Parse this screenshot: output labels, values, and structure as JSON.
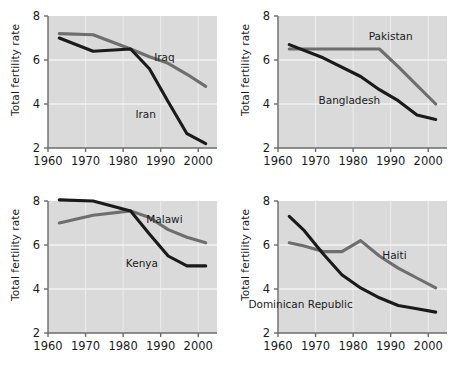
{
  "figure": {
    "title": "",
    "background": "#ffffff",
    "panel_background": "#dadada",
    "grid_color": "#f2f2f2",
    "axis_color": "#6b6b6b",
    "dark_series_color": "#1a1a1a",
    "light_series_color": "#6e6e6e"
  },
  "axis": {
    "ylabel": "Total fertility rate",
    "yticks": [
      "8",
      "6",
      "4",
      "2"
    ],
    "ytick_values": [
      8,
      6,
      4,
      2
    ],
    "ylim": [
      2,
      8
    ],
    "xticks": [
      "1960",
      "1970",
      "1980",
      "1990",
      "2000"
    ],
    "xtick_values": [
      1960,
      1970,
      1980,
      1990,
      2000
    ],
    "xlim": [
      1960,
      2005
    ]
  },
  "chart_data": [
    {
      "type": "line",
      "panel": "top-left",
      "title": "",
      "xlabel": "",
      "ylabel": "Total fertility rate",
      "xlim": [
        1960,
        2005
      ],
      "ylim": [
        2,
        8
      ],
      "grid": true,
      "legend": "inline-labels",
      "series": [
        {
          "name": "Iraq",
          "color": "#6e6e6e",
          "label_x": 1991,
          "label_y": 5.95,
          "x": [
            1963,
            1972,
            1982,
            1987,
            1992,
            1997,
            2002
          ],
          "values": [
            7.2,
            7.15,
            6.5,
            6.15,
            5.85,
            5.35,
            4.8
          ]
        },
        {
          "name": "Iran",
          "color": "#1a1a1a",
          "label_x": 1986,
          "label_y": 3.35,
          "x": [
            1963,
            1972,
            1982,
            1987,
            1992,
            1997,
            2002
          ],
          "values": [
            7.0,
            6.4,
            6.5,
            5.6,
            4.1,
            2.65,
            2.2
          ]
        }
      ]
    },
    {
      "type": "line",
      "panel": "top-right",
      "title": "",
      "xlabel": "",
      "ylabel": "Total fertility rate",
      "xlim": [
        1960,
        2005
      ],
      "ylim": [
        2,
        8
      ],
      "grid": true,
      "legend": "inline-labels",
      "series": [
        {
          "name": "Pakistan",
          "color": "#6e6e6e",
          "label_x": 1990,
          "label_y": 6.9,
          "x": [
            1963,
            1972,
            1982,
            1987,
            1992,
            1997,
            2002
          ],
          "values": [
            6.5,
            6.5,
            6.5,
            6.5,
            5.7,
            4.85,
            4.0
          ]
        },
        {
          "name": "Bangladesh",
          "color": "#1a1a1a",
          "label_x": 1979,
          "label_y": 4.0,
          "x": [
            1963,
            1972,
            1982,
            1987,
            1992,
            1997,
            2002
          ],
          "values": [
            6.7,
            6.1,
            5.25,
            4.65,
            4.15,
            3.5,
            3.3
          ]
        }
      ]
    },
    {
      "type": "line",
      "panel": "bottom-left",
      "title": "",
      "xlabel": "",
      "ylabel": "Total fertility rate",
      "xlim": [
        1960,
        2005
      ],
      "ylim": [
        2,
        8
      ],
      "grid": true,
      "legend": "inline-labels",
      "series": [
        {
          "name": "Malawi",
          "color": "#6e6e6e",
          "label_x": 1991,
          "label_y": 7.0,
          "x": [
            1963,
            1972,
            1982,
            1987,
            1992,
            1997,
            2002
          ],
          "values": [
            7.0,
            7.35,
            7.55,
            7.25,
            6.7,
            6.35,
            6.1
          ]
        },
        {
          "name": "Kenya",
          "color": "#1a1a1a",
          "label_x": 1985,
          "label_y": 5.0,
          "x": [
            1963,
            1972,
            1982,
            1987,
            1992,
            1997,
            2002
          ],
          "values": [
            8.05,
            8.0,
            7.55,
            6.5,
            5.5,
            5.05,
            5.05
          ]
        }
      ]
    },
    {
      "type": "line",
      "panel": "bottom-right",
      "title": "",
      "xlabel": "",
      "ylabel": "Total fertility rate",
      "xlim": [
        1960,
        2005
      ],
      "ylim": [
        2,
        8
      ],
      "grid": true,
      "legend": "inline-labels",
      "series": [
        {
          "name": "Haiti",
          "color": "#6e6e6e",
          "label_x": 1991,
          "label_y": 5.35,
          "x": [
            1963,
            1967,
            1972,
            1977,
            1982,
            1987,
            1992,
            1997,
            2002
          ],
          "values": [
            6.1,
            5.95,
            5.7,
            5.7,
            6.2,
            5.5,
            4.95,
            4.5,
            4.05
          ]
        },
        {
          "name": "Dominican Republic",
          "color": "#1a1a1a",
          "label_x": 1966,
          "label_y": 3.15,
          "x": [
            1963,
            1967,
            1972,
            1977,
            1982,
            1987,
            1992,
            1997,
            2002
          ],
          "values": [
            7.3,
            6.65,
            5.6,
            4.65,
            4.05,
            3.6,
            3.25,
            3.1,
            2.95
          ]
        }
      ]
    }
  ]
}
